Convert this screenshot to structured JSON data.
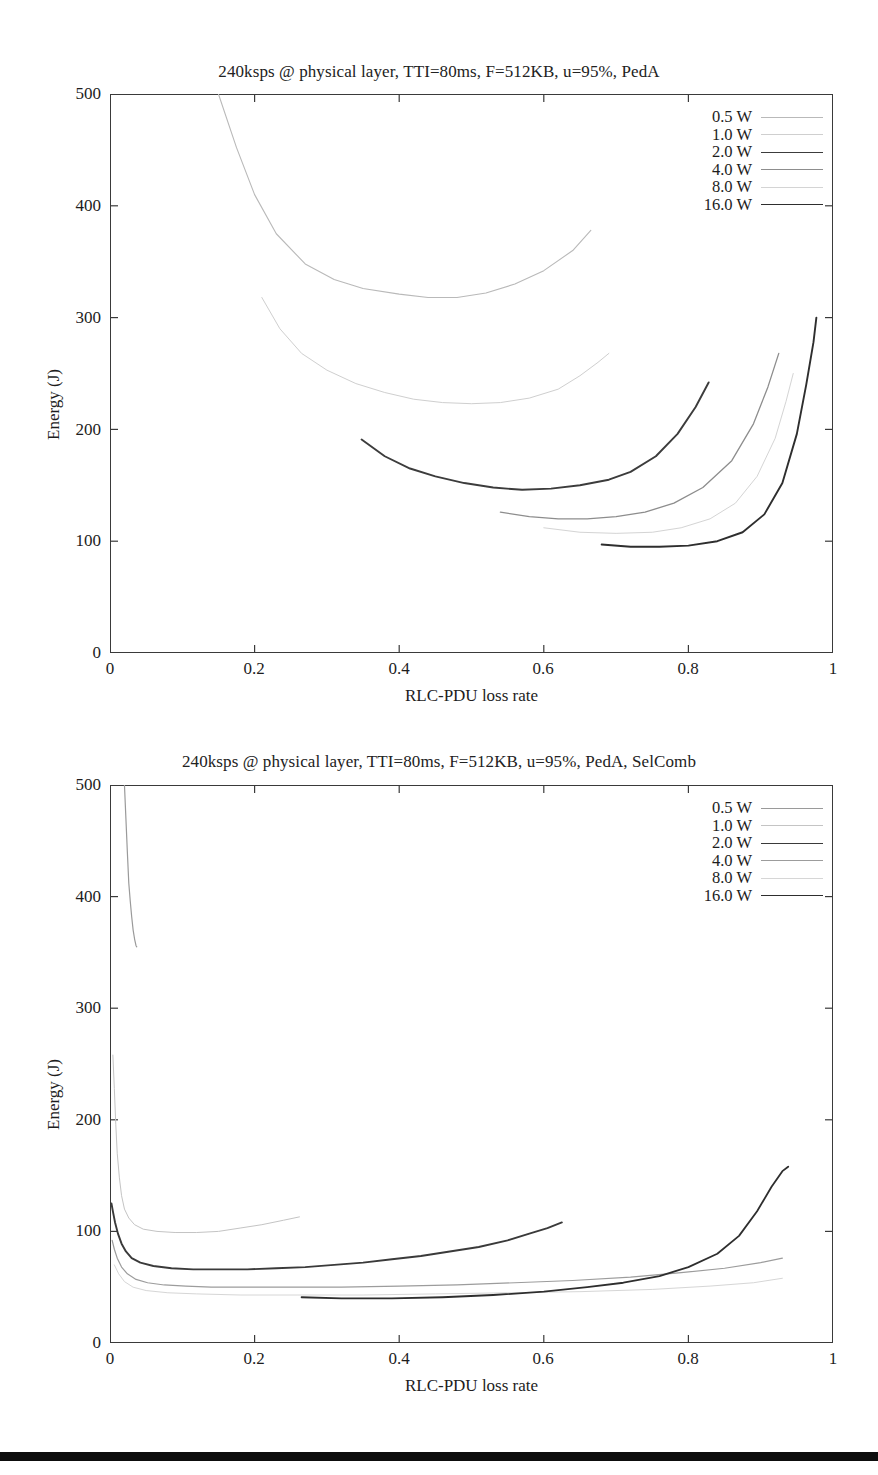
{
  "figures": [
    {
      "id": "figure-1",
      "title": "240ksps @ physical layer, TTI=80ms, F=512KB, u=95%, PedA",
      "axis": {
        "xlabel": "RLC-PDU loss rate",
        "ylabel": "Energy (J)",
        "xticks": [
          "0",
          "0.2",
          "0.4",
          "0.6",
          "0.8",
          "1"
        ],
        "yticks": [
          "0",
          "100",
          "200",
          "300",
          "400",
          "500"
        ]
      },
      "legend": [
        {
          "label": "0.5 W",
          "color": "#b9b9b9",
          "width": 1.1
        },
        {
          "label": "1.0 W",
          "color": "#cfcfcf",
          "width": 1.0
        },
        {
          "label": "2.0 W",
          "color": "#3c3c3c",
          "width": 1.9
        },
        {
          "label": "4.0 W",
          "color": "#8d8d8d",
          "width": 1.3
        },
        {
          "label": "8.0 W",
          "color": "#d4d4d4",
          "width": 1.0
        },
        {
          "label": "16.0 W",
          "color": "#2e2e2e",
          "width": 1.9
        }
      ],
      "chart_data": {
        "type": "line",
        "title": "240ksps @ physical layer, TTI=80ms, F=512KB, u=95%, PedA",
        "xlabel": "RLC-PDU loss rate",
        "ylabel": "Energy (J)",
        "xlim": [
          0,
          1
        ],
        "ylim": [
          0,
          500
        ],
        "grid": false,
        "legend_position": "top-right",
        "series": [
          {
            "name": "0.5 W",
            "points": [
              [
                0.15,
                500
              ],
              [
                0.175,
                452
              ],
              [
                0.2,
                410
              ],
              [
                0.23,
                375
              ],
              [
                0.27,
                348
              ],
              [
                0.31,
                334
              ],
              [
                0.35,
                326
              ],
              [
                0.4,
                321
              ],
              [
                0.44,
                318
              ],
              [
                0.48,
                318
              ],
              [
                0.52,
                322
              ],
              [
                0.56,
                330
              ],
              [
                0.6,
                342
              ],
              [
                0.64,
                360
              ],
              [
                0.665,
                378
              ]
            ]
          },
          {
            "name": "1.0 W",
            "points": [
              [
                0.21,
                318
              ],
              [
                0.235,
                290
              ],
              [
                0.265,
                268
              ],
              [
                0.3,
                253
              ],
              [
                0.34,
                241
              ],
              [
                0.38,
                233
              ],
              [
                0.42,
                227
              ],
              [
                0.46,
                224
              ],
              [
                0.5,
                223
              ],
              [
                0.54,
                224
              ],
              [
                0.58,
                228
              ],
              [
                0.62,
                236
              ],
              [
                0.65,
                248
              ],
              [
                0.675,
                260
              ],
              [
                0.69,
                268
              ]
            ]
          },
          {
            "name": "2.0 W",
            "points": [
              [
                0.348,
                191
              ],
              [
                0.38,
                176
              ],
              [
                0.415,
                165
              ],
              [
                0.45,
                158
              ],
              [
                0.49,
                152
              ],
              [
                0.53,
                148
              ],
              [
                0.57,
                146
              ],
              [
                0.61,
                147
              ],
              [
                0.65,
                150
              ],
              [
                0.69,
                155
              ],
              [
                0.72,
                162
              ],
              [
                0.755,
                176
              ],
              [
                0.785,
                196
              ],
              [
                0.81,
                220
              ],
              [
                0.828,
                242
              ]
            ]
          },
          {
            "name": "4.0 W",
            "points": [
              [
                0.54,
                126
              ],
              [
                0.58,
                122
              ],
              [
                0.62,
                120
              ],
              [
                0.66,
                120
              ],
              [
                0.7,
                122
              ],
              [
                0.74,
                126
              ],
              [
                0.78,
                134
              ],
              [
                0.82,
                148
              ],
              [
                0.86,
                172
              ],
              [
                0.89,
                205
              ],
              [
                0.91,
                238
              ],
              [
                0.925,
                268
              ]
            ]
          },
          {
            "name": "8.0 W",
            "points": [
              [
                0.6,
                112
              ],
              [
                0.65,
                108
              ],
              [
                0.7,
                107
              ],
              [
                0.75,
                108
              ],
              [
                0.79,
                112
              ],
              [
                0.83,
                120
              ],
              [
                0.865,
                134
              ],
              [
                0.895,
                158
              ],
              [
                0.92,
                192
              ],
              [
                0.935,
                225
              ],
              [
                0.945,
                250
              ]
            ]
          },
          {
            "name": "16.0 W",
            "points": [
              [
                0.68,
                97
              ],
              [
                0.72,
                95
              ],
              [
                0.76,
                95
              ],
              [
                0.8,
                96
              ],
              [
                0.84,
                100
              ],
              [
                0.875,
                108
              ],
              [
                0.905,
                124
              ],
              [
                0.93,
                152
              ],
              [
                0.95,
                196
              ],
              [
                0.963,
                240
              ],
              [
                0.973,
                278
              ],
              [
                0.977,
                300
              ]
            ]
          }
        ]
      }
    },
    {
      "id": "figure-2",
      "title": "240ksps @ physical layer, TTI=80ms, F=512KB, u=95%, PedA, SelComb",
      "axis": {
        "xlabel": "RLC-PDU loss rate",
        "ylabel": "Energy (J)",
        "xticks": [
          "0",
          "0.2",
          "0.4",
          "0.6",
          "0.8",
          "1"
        ],
        "yticks": [
          "0",
          "100",
          "200",
          "300",
          "400",
          "500"
        ]
      },
      "legend": [
        {
          "label": "0.5 W",
          "color": "#9a9a9a",
          "width": 1.2
        },
        {
          "label": "1.0 W",
          "color": "#c4c4c4",
          "width": 1.0
        },
        {
          "label": "2.0 W",
          "color": "#3a3a3a",
          "width": 1.9
        },
        {
          "label": "4.0 W",
          "color": "#9c9c9c",
          "width": 1.2
        },
        {
          "label": "8.0 W",
          "color": "#d6d6d6",
          "width": 1.0
        },
        {
          "label": "16.0 W",
          "color": "#2e2e2e",
          "width": 1.8
        }
      ],
      "chart_data": {
        "type": "line",
        "title": "240ksps @ physical layer, TTI=80ms, F=512KB, u=95%, PedA, SelComb",
        "xlabel": "RLC-PDU loss rate",
        "ylabel": "Energy (J)",
        "xlim": [
          0,
          1
        ],
        "ylim": [
          0,
          500
        ],
        "grid": false,
        "legend_position": "top-right",
        "series": [
          {
            "name": "0.5 W",
            "points": [
              [
                0.02,
                500
              ],
              [
                0.022,
                470
              ],
              [
                0.024,
                440
              ],
              [
                0.026,
                412
              ],
              [
                0.028,
                396
              ],
              [
                0.03,
                382
              ],
              [
                0.032,
                370
              ],
              [
                0.034,
                362
              ],
              [
                0.036,
                356
              ],
              [
                0.037,
                355
              ]
            ]
          },
          {
            "name": "1.0 W",
            "points": [
              [
                0.004,
                258
              ],
              [
                0.006,
                228
              ],
              [
                0.008,
                196
              ],
              [
                0.01,
                170
              ],
              [
                0.013,
                148
              ],
              [
                0.016,
                132
              ],
              [
                0.02,
                120
              ],
              [
                0.026,
                112
              ],
              [
                0.034,
                106
              ],
              [
                0.046,
                102
              ],
              [
                0.065,
                100
              ],
              [
                0.09,
                99
              ],
              [
                0.12,
                99
              ],
              [
                0.15,
                100
              ],
              [
                0.18,
                103
              ],
              [
                0.21,
                106
              ],
              [
                0.24,
                110
              ],
              [
                0.262,
                113
              ]
            ]
          },
          {
            "name": "2.0 W",
            "points": [
              [
                0.002,
                125
              ],
              [
                0.004,
                118
              ],
              [
                0.007,
                108
              ],
              [
                0.011,
                98
              ],
              [
                0.016,
                89
              ],
              [
                0.022,
                82
              ],
              [
                0.03,
                76
              ],
              [
                0.042,
                72
              ],
              [
                0.06,
                69
              ],
              [
                0.085,
                67
              ],
              [
                0.115,
                66
              ],
              [
                0.15,
                66
              ],
              [
                0.19,
                66
              ],
              [
                0.23,
                67
              ],
              [
                0.27,
                68
              ],
              [
                0.31,
                70
              ],
              [
                0.35,
                72
              ],
              [
                0.39,
                75
              ],
              [
                0.43,
                78
              ],
              [
                0.47,
                82
              ],
              [
                0.51,
                86
              ],
              [
                0.55,
                92
              ],
              [
                0.58,
                98
              ],
              [
                0.605,
                103
              ],
              [
                0.625,
                108
              ]
            ]
          },
          {
            "name": "4.0 W",
            "points": [
              [
                0.003,
                92
              ],
              [
                0.006,
                84
              ],
              [
                0.01,
                76
              ],
              [
                0.016,
                68
              ],
              [
                0.024,
                62
              ],
              [
                0.036,
                57
              ],
              [
                0.052,
                54
              ],
              [
                0.075,
                52
              ],
              [
                0.105,
                51
              ],
              [
                0.14,
                50
              ],
              [
                0.19,
                50
              ],
              [
                0.25,
                50
              ],
              [
                0.32,
                50
              ],
              [
                0.4,
                51
              ],
              [
                0.48,
                52
              ],
              [
                0.56,
                54
              ],
              [
                0.64,
                56
              ],
              [
                0.72,
                59
              ],
              [
                0.79,
                63
              ],
              [
                0.85,
                67
              ],
              [
                0.9,
                72
              ],
              [
                0.93,
                76
              ]
            ]
          },
          {
            "name": "8.0 W",
            "points": [
              [
                0.006,
                70
              ],
              [
                0.012,
                62
              ],
              [
                0.02,
                55
              ],
              [
                0.032,
                50
              ],
              [
                0.05,
                47
              ],
              [
                0.08,
                45
              ],
              [
                0.12,
                44
              ],
              [
                0.18,
                43
              ],
              [
                0.26,
                43
              ],
              [
                0.35,
                43
              ],
              [
                0.45,
                44
              ],
              [
                0.55,
                45
              ],
              [
                0.65,
                46
              ],
              [
                0.75,
                48
              ],
              [
                0.83,
                51
              ],
              [
                0.89,
                54
              ],
              [
                0.93,
                58
              ]
            ]
          },
          {
            "name": "16.0 W",
            "points": [
              [
                0.265,
                41
              ],
              [
                0.32,
                40
              ],
              [
                0.39,
                40
              ],
              [
                0.46,
                41
              ],
              [
                0.53,
                43
              ],
              [
                0.6,
                46
              ],
              [
                0.66,
                50
              ],
              [
                0.71,
                54
              ],
              [
                0.76,
                60
              ],
              [
                0.8,
                68
              ],
              [
                0.84,
                80
              ],
              [
                0.87,
                96
              ],
              [
                0.895,
                118
              ],
              [
                0.915,
                140
              ],
              [
                0.93,
                154
              ],
              [
                0.938,
                158
              ]
            ]
          }
        ]
      }
    }
  ],
  "page": {
    "bottom_rule_color": "#0d0d0d"
  }
}
